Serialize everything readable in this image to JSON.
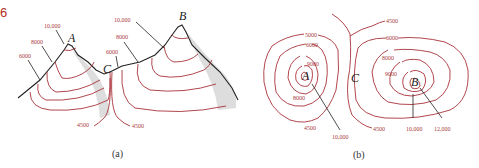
{
  "figure_number": "6",
  "colors": {
    "contour": "#a8323a",
    "label": "#a83a3a",
    "ink": "#222222",
    "figure_number": "#b03020"
  },
  "panel_a": {
    "caption": "(a)",
    "points": {
      "A": "A",
      "B": "B",
      "C": "C"
    },
    "labels": {
      "peak_a_10000": "10,000",
      "peak_a_8000": "8000",
      "peak_a_6000": "6000",
      "peak_b_10000": "10,000",
      "peak_b_8000": "8000",
      "saddle_6000": "6000",
      "base_left_4500": "4500",
      "base_right_4500": "4500"
    }
  },
  "panel_b": {
    "caption": "(b)",
    "points": {
      "A": "A",
      "B": "B",
      "C": "C"
    },
    "labels": {
      "left_5000": "5000",
      "left_6000": "6000",
      "left_9000": "9000",
      "left_8000": "8000",
      "left_4500": "4500",
      "left_10000": "10,000",
      "top_4500": "4500",
      "right_6000": "6000",
      "right_8000": "8000",
      "right_9000": "9000",
      "bottom_4500": "4500",
      "right_10000": "10,000",
      "right_12000": "12,000"
    }
  }
}
